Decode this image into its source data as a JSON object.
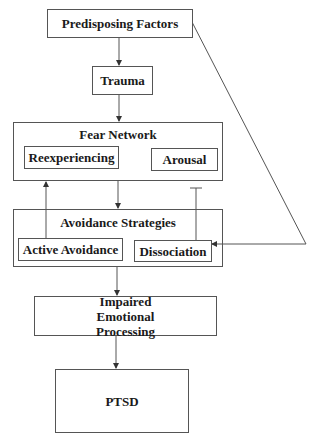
{
  "diagram": {
    "nodes": {
      "predisposing": "Predisposing Factors",
      "trauma": "Trauma",
      "fear_network": {
        "title": "Fear Network",
        "children": [
          "Reexperiencing",
          "Arousal"
        ]
      },
      "avoidance": {
        "title": "Avoidance Strategies",
        "children": [
          "Active Avoidance",
          "Dissociation"
        ]
      },
      "impaired": "Impaired Emotional Processing",
      "ptsd": "PTSD"
    },
    "edges": [
      {
        "from": "Predisposing Factors",
        "to": "Trauma",
        "type": "arrow"
      },
      {
        "from": "Trauma",
        "to": "Fear Network",
        "type": "arrow"
      },
      {
        "from": "Fear Network",
        "to": "Avoidance Strategies",
        "type": "arrow"
      },
      {
        "from": "Active Avoidance",
        "to": "Reexperiencing",
        "type": "arrow"
      },
      {
        "from": "Dissociation",
        "to": "Arousal",
        "type": "inhibit"
      },
      {
        "from": "Predisposing Factors",
        "to": "Dissociation",
        "type": "arrow"
      },
      {
        "from": "Avoidance Strategies",
        "to": "Impaired Emotional Processing",
        "type": "arrow"
      },
      {
        "from": "Impaired Emotional Processing",
        "to": "PTSD",
        "type": "arrow"
      }
    ],
    "colors": {
      "line": "#555555",
      "text": "#1a1a1a",
      "background": "#ffffff"
    }
  }
}
